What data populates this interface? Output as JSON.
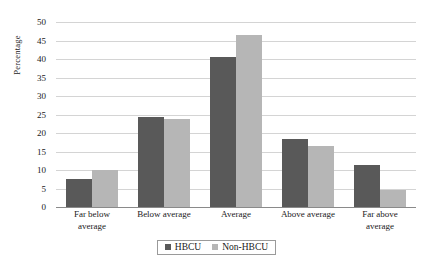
{
  "chart_data": {
    "type": "bar",
    "title": "",
    "xlabel": "",
    "ylabel": "Percentage",
    "ylim": [
      0,
      50
    ],
    "ytick_step": 5,
    "yticks": [
      50,
      45,
      40,
      35,
      30,
      25,
      20,
      15,
      10,
      5,
      0
    ],
    "grid": true,
    "legend_position": "bottom",
    "categories": [
      "Far below average",
      "Below average",
      "Average",
      "Above average",
      "Far above average"
    ],
    "category_lines": [
      [
        "Far below",
        "average"
      ],
      [
        "Below average"
      ],
      [
        "Average"
      ],
      [
        "Above average"
      ],
      [
        "Far above",
        "average"
      ]
    ],
    "series": [
      {
        "name": "HBCU",
        "color": "#595959",
        "values": [
          7.5,
          24.3,
          40.5,
          18.3,
          11.3
        ]
      },
      {
        "name": "Non-HBCU",
        "color": "#b6b6b6",
        "values": [
          10.0,
          23.9,
          46.5,
          16.5,
          4.6
        ]
      }
    ]
  }
}
